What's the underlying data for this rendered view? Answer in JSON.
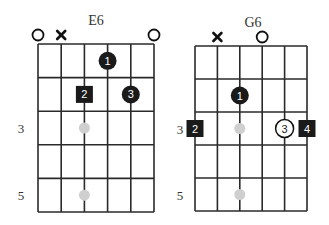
{
  "colors": {
    "grid": "#2a2a2a",
    "finger_fill": "#1a1a1a",
    "finger_text": "#ffffff",
    "open_finger_fill": "#ffffff",
    "open_finger_text": "#222222",
    "position_dot": "#cfcfcf",
    "text": "#333333"
  },
  "diagrams": [
    {
      "name": "E6",
      "title_pos": [
        96,
        25
      ],
      "grid": {
        "x0": 38,
        "x1": 154,
        "y0": 44,
        "y1": 212,
        "strings": 6,
        "frets": 5
      },
      "fret_labels": [
        {
          "text": "3",
          "fret": 3,
          "x": 21
        },
        {
          "text": "5",
          "fret": 5,
          "x": 21
        }
      ],
      "top_markers": [
        {
          "string": 0,
          "type": "open"
        },
        {
          "string": 1,
          "type": "mute"
        },
        {
          "string": 5,
          "type": "open"
        }
      ],
      "position_dots": [
        {
          "string": 2,
          "fret": 3
        },
        {
          "string": 2,
          "fret": 5
        }
      ],
      "fingers": [
        {
          "label": "1",
          "string": 3,
          "fret": 1,
          "shape": "circle",
          "style": "filled"
        },
        {
          "label": "2",
          "string": 2,
          "fret": 2,
          "shape": "square",
          "style": "filled"
        },
        {
          "label": "3",
          "string": 4,
          "fret": 2,
          "shape": "circle",
          "style": "filled"
        }
      ]
    },
    {
      "name": "G6",
      "title_pos": [
        253,
        27
      ],
      "grid": {
        "x0": 195,
        "x1": 307,
        "y0": 46,
        "y1": 211,
        "strings": 6,
        "frets": 5
      },
      "fret_labels": [
        {
          "text": "3",
          "fret": 3,
          "x": 180
        },
        {
          "text": "5",
          "fret": 5,
          "x": 180
        }
      ],
      "top_markers": [
        {
          "string": 1,
          "type": "mute"
        },
        {
          "string": 3,
          "type": "open"
        }
      ],
      "position_dots": [
        {
          "string": 2,
          "fret": 3
        },
        {
          "string": 2,
          "fret": 5
        }
      ],
      "fingers": [
        {
          "label": "1",
          "string": 2,
          "fret": 2,
          "shape": "circle",
          "style": "filled"
        },
        {
          "label": "2",
          "string": 0,
          "fret": 3,
          "shape": "square",
          "style": "filled"
        },
        {
          "label": "3",
          "string": 4,
          "fret": 3,
          "shape": "circle",
          "style": "outline"
        },
        {
          "label": "4",
          "string": 5,
          "fret": 3,
          "shape": "square",
          "style": "filled"
        }
      ]
    }
  ]
}
